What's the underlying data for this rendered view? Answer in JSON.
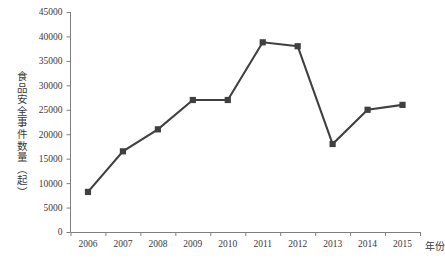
{
  "chart_data": {
    "type": "line",
    "title": "",
    "xlabel": "年份",
    "ylabel": "食品安全事件数量（起）",
    "categories": [
      "2006",
      "2007",
      "2008",
      "2009",
      "2010",
      "2011",
      "2012",
      "2013",
      "2014",
      "2015"
    ],
    "values": [
      8200,
      16500,
      21000,
      27000,
      27000,
      38800,
      38000,
      18000,
      25000,
      26000
    ],
    "series": [
      {
        "name": "食品安全事件数量",
        "values": [
          8200,
          16500,
          21000,
          27000,
          27000,
          38800,
          38000,
          18000,
          25000,
          26000
        ]
      }
    ],
    "ylim": [
      0,
      45000
    ],
    "ytick_labels": [
      "45000",
      "40000",
      "35000",
      "30000",
      "25000",
      "20000",
      "15000",
      "10000",
      "5000",
      "0"
    ],
    "ytick_values": [
      45000,
      40000,
      35000,
      30000,
      25000,
      20000,
      15000,
      10000,
      5000,
      0
    ],
    "ytick_step": 5000,
    "grid": false,
    "legend": "none",
    "marker": "square",
    "line_color": "#404040",
    "marker_color": "#404040",
    "axis_color": "#7f7f7f",
    "text_color": "#3a3a3a"
  }
}
